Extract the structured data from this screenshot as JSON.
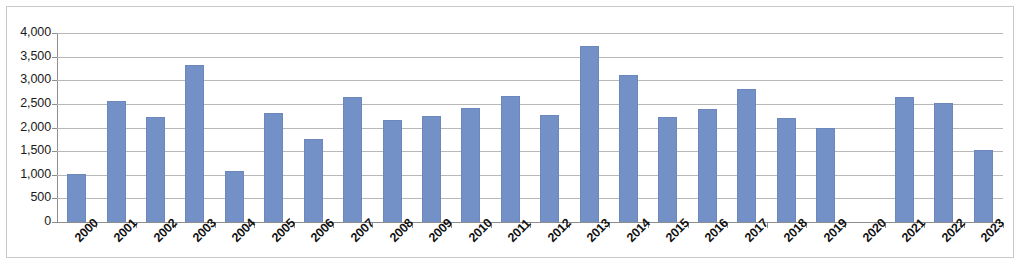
{
  "chart_data": {
    "type": "bar",
    "title": "",
    "subtitle": "",
    "xlabel": "",
    "ylabel": "",
    "ylim": [
      0,
      4000
    ],
    "ytick_step": 500,
    "ytick_labels": [
      "4,000",
      "3,500",
      "3,000",
      "2,500",
      "2,000",
      "1,500",
      "1,000",
      "500",
      "0"
    ],
    "ytick_values": [
      4000,
      3500,
      3000,
      2500,
      2000,
      1500,
      1000,
      500,
      0
    ],
    "grid": true,
    "legend": false,
    "legend_position": "none",
    "bar_color": "#7391c7",
    "gridline_color": "#b8b8b8",
    "axis_color": "#8d8d8d",
    "categories": [
      "2000",
      "2001",
      "2002",
      "2003",
      "2004",
      "2005",
      "2006",
      "2007",
      "2008",
      "2009",
      "2010",
      "2011",
      "2012",
      "2013",
      "2014",
      "2015",
      "2016",
      "2017",
      "2018",
      "2019",
      "2020",
      "2021",
      "2022",
      "2023"
    ],
    "values": [
      1010,
      2560,
      2220,
      3330,
      1070,
      2300,
      1750,
      2650,
      2150,
      2240,
      2420,
      2660,
      2260,
      3720,
      3110,
      2230,
      2390,
      2820,
      2200,
      1980,
      0,
      2640,
      2510,
      1520
    ],
    "series": [
      {
        "name": "Series 1",
        "values": [
          1010,
          2560,
          2220,
          3330,
          1070,
          2300,
          1750,
          2650,
          2150,
          2240,
          2420,
          2660,
          2260,
          3720,
          3110,
          2230,
          2390,
          2820,
          2200,
          1980,
          0,
          2640,
          2510,
          1520
        ]
      }
    ]
  }
}
